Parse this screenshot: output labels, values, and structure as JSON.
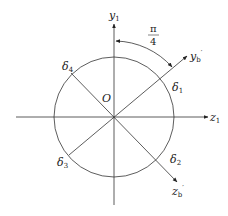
{
  "diagram": {
    "type": "coordinate-rotation",
    "center_label": "O",
    "axes": {
      "y1": {
        "base": "y",
        "sub": "1"
      },
      "z1": {
        "base": "z",
        "sub": "1"
      },
      "yb": {
        "base": "y",
        "sub": "b",
        "prime": "′"
      },
      "zb": {
        "base": "z",
        "sub": "b",
        "prime": "′"
      }
    },
    "angle": {
      "numerator": "π",
      "denominator": "4"
    },
    "points": [
      {
        "base": "δ",
        "sub": "1"
      },
      {
        "base": "δ",
        "sub": "2"
      },
      {
        "base": "δ",
        "sub": "3"
      },
      {
        "base": "δ",
        "sub": "4"
      }
    ],
    "colors": {
      "stroke": "#333333",
      "background": "#ffffff"
    }
  }
}
